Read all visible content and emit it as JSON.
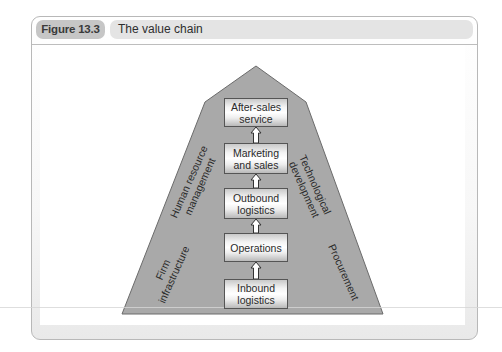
{
  "figure": {
    "number": "Figure 13.3",
    "title": "The value chain"
  },
  "primary_activities": [
    {
      "label": "After-sales service",
      "line1": "After-sales",
      "line2": "service"
    },
    {
      "label": "Marketing and sales",
      "line1": "Marketing",
      "line2": "and sales"
    },
    {
      "label": "Outbound logistics",
      "line1": "Outbound",
      "line2": "logistics"
    },
    {
      "label": "Operations",
      "line1": "Operations",
      "line2": ""
    },
    {
      "label": "Inbound logistics",
      "line1": "Inbound",
      "line2": "logistics"
    }
  ],
  "support_activities": {
    "left": [
      {
        "line1": "Firm",
        "line2": "infrastructure"
      },
      {
        "line1": "Human resource",
        "line2": "management"
      }
    ],
    "right": [
      {
        "line1": "Technological",
        "line2": "development"
      },
      {
        "line1": "Procurement",
        "line2": ""
      }
    ]
  },
  "colors": {
    "pyramid_fill": "#a9a9a9",
    "pyramid_stroke": "#6b6b6b",
    "figure_pill": "#c6c6c6",
    "title_pill": "#e4e4e4"
  }
}
